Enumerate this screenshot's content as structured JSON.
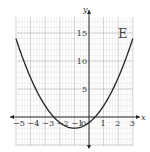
{
  "chart_data": {
    "type": "line",
    "title": "",
    "panel_label": "E",
    "xlabel": "x",
    "ylabel": "y",
    "xlim": [
      -5,
      3
    ],
    "ylim": [
      -5,
      18
    ],
    "grid": true,
    "x_ticks": [
      -5,
      -4,
      -3,
      -2,
      -1,
      0,
      1,
      2,
      3
    ],
    "x_tick_labels": [
      "−5",
      "−4",
      "−3",
      "−2",
      "−1",
      "0",
      "1",
      "2",
      "3"
    ],
    "y_ticks": [
      5,
      10,
      15
    ],
    "y_tick_labels": [
      "5",
      "10",
      "15"
    ],
    "series": [
      {
        "name": "y = (x + 1)^2 − 2",
        "x": [
          -5,
          -4,
          -3,
          -2,
          -1,
          0,
          1,
          2,
          3
        ],
        "y": [
          14,
          7,
          2,
          -1,
          -2,
          -1,
          2,
          7,
          14
        ]
      }
    ],
    "colors": {
      "curve": "#222222",
      "grid_major": "#b0b0b0",
      "grid_minor": "#dedede",
      "axis": "#222222"
    }
  }
}
